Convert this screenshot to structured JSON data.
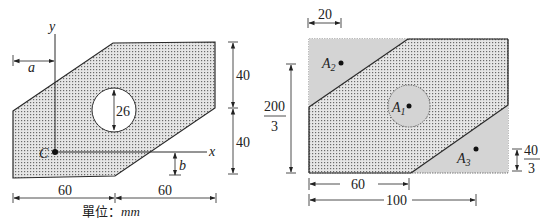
{
  "left_figure": {
    "axis_x_label": "x",
    "axis_y_label": "y",
    "centroid_label": "C",
    "dim_a": "a",
    "dim_b": "b",
    "hole_diameter": "26",
    "dim_top_height": "40",
    "dim_bottom_height": "40",
    "dim_left_width": "60",
    "dim_right_width": "60",
    "unit_prefix": "單位：",
    "unit": "mm"
  },
  "right_figure": {
    "dim_top_offset": "20",
    "dim_height_num": "200",
    "dim_height_den": "3",
    "dim_small_num": "40",
    "dim_small_den": "3",
    "dim_inner_width": "60",
    "dim_total_width": "100",
    "area_labels": [
      {
        "main": "A",
        "sub": "2"
      },
      {
        "main": "A",
        "sub": "1"
      },
      {
        "main": "A",
        "sub": "3"
      }
    ]
  },
  "colors": {
    "stroke": "#2a2a2a",
    "dot_fill": "#9a9a9a",
    "gray_region": "#d4d4d4"
  }
}
